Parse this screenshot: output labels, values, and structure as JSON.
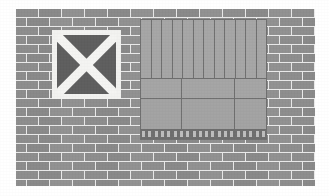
{
  "scene": {
    "title": "Brick wall with boarded window and roller shutter",
    "width": 329,
    "height": 196,
    "background_color": "#ffffff"
  },
  "wall": {
    "name": "brick-wall",
    "description": "Grey running-bond brick wall",
    "brick_color": "#8d8d8d",
    "mortar_color": "#e9e9e9",
    "bond": "running bond",
    "rows": 18,
    "bricks_per_row": 13,
    "brick_width_px": 22,
    "brick_height_px": 8,
    "mortar_px": 1,
    "left_px": 16,
    "top_px": 9,
    "width_px": 299,
    "height_px": 177
  },
  "x_panel": {
    "name": "boarded-window-x",
    "label": "Boarded window with X cross bracing",
    "frame_color": "#f2f2f0",
    "fill_color": "#5e5e5e",
    "cross_color": "#f4f4f2",
    "left_px": 52,
    "top_px": 30,
    "size_px": 69,
    "frame_thickness_px": 5,
    "cross_bar_width_px": 9,
    "bars": 2
  },
  "shutter_panel": {
    "name": "roller-shutter",
    "label": "Roller shutter over shopfront opening",
    "body_color": "#a2a2a2",
    "outline_color": "#6f6f6f",
    "rail_color": "#6e6e6e",
    "tick_color": "#bdbdbd",
    "left_px": 140,
    "top_px": 19,
    "width_px": 127,
    "height_px": 121,
    "slat_count": 12,
    "slat_band_height_px": 58,
    "mid_band_height_px": 20,
    "lower_band_height_px": 32,
    "bottom_rail_height_px": 10,
    "tick_count": 20,
    "horizontal_divider_y": [
      58,
      78
    ],
    "vertical_divider_x": [
      40,
      93
    ]
  }
}
